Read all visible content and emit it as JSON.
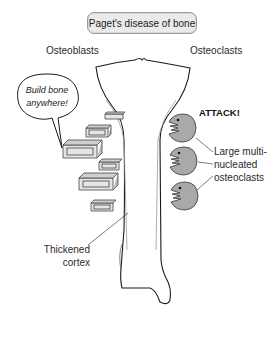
{
  "title": "Paget's disease of bone",
  "labels": {
    "osteoblasts": "Osteoblasts",
    "osteoclasts": "Osteoclasts",
    "attack": "ATTACK!",
    "large_line1": "Large multi-",
    "large_line2": "nucleated",
    "large_line3": "osteoclasts",
    "thickened_line1": "Thickened",
    "thickened_line2": "cortex"
  },
  "speech_bubble": {
    "line1": "Build bone",
    "line2": "anywhere!"
  },
  "colors": {
    "osteoclast_fill": "#a9a9a9",
    "outline": "#1a1a1a",
    "title_bg": "#ebebeb",
    "block_fill": "#e6e6e6"
  },
  "icons": {
    "osteoblast_block": "3d-rectangular-block",
    "osteoclast": "pacman-monster-with-teeth"
  }
}
